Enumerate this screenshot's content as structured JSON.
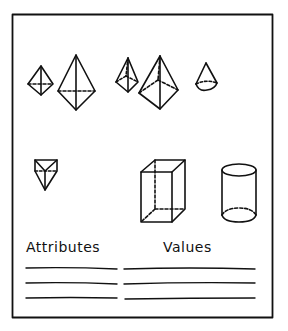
{
  "worksheet": {
    "stroke_color": "#111111",
    "background": "#ffffff",
    "shapes": [
      {
        "name": "small-octahedron"
      },
      {
        "name": "triangular-bipyramid"
      },
      {
        "name": "small-square-pyramid"
      },
      {
        "name": "large-square-pyramid"
      },
      {
        "name": "cone"
      },
      {
        "name": "triangular-prism"
      },
      {
        "name": "rectangular-prism"
      },
      {
        "name": "cylinder"
      }
    ],
    "table": {
      "headers": {
        "attributes": "Attributes",
        "values": "Values"
      },
      "rows": 3
    }
  }
}
